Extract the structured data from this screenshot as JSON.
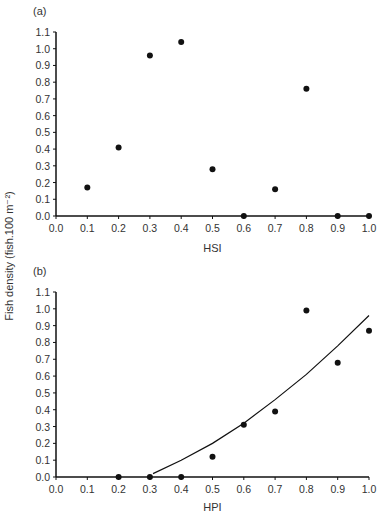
{
  "figure": {
    "ylabel": "Fish density (fish.100 m⁻²)",
    "panels": [
      {
        "label": "(a)",
        "xlabel": "HSI"
      },
      {
        "label": "(b)",
        "xlabel": "HPI"
      }
    ]
  },
  "chart_data": [
    {
      "type": "scatter",
      "title": "(a)",
      "xlabel": "HSI",
      "ylabel": "Fish density (fish.100 m-2)",
      "xlim": [
        0.0,
        1.0
      ],
      "ylim": [
        0.0,
        1.1
      ],
      "xticks": [
        "0.0",
        "0.1",
        "0.2",
        "0.3",
        "0.4",
        "0.5",
        "0.6",
        "0.7",
        "0.8",
        "0.9",
        "1.0"
      ],
      "yticks": [
        "0.0",
        "0.1",
        "0.2",
        "0.3",
        "0.4",
        "0.5",
        "0.6",
        "0.7",
        "0.8",
        "0.9",
        "1.0",
        "1.1"
      ],
      "grid": false,
      "series": [
        {
          "name": "observed",
          "x": [
            0.1,
            0.2,
            0.3,
            0.4,
            0.5,
            0.6,
            0.7,
            0.8,
            0.9,
            1.0
          ],
          "y": [
            0.17,
            0.41,
            0.96,
            1.04,
            0.28,
            0.0,
            0.16,
            0.76,
            0.0,
            0.0
          ]
        }
      ]
    },
    {
      "type": "scatter",
      "title": "(b)",
      "xlabel": "HPI",
      "ylabel": "Fish density (fish.100 m-2)",
      "xlim": [
        0.0,
        1.0
      ],
      "ylim": [
        0.0,
        1.1
      ],
      "xticks": [
        "0.0",
        "0.1",
        "0.2",
        "0.3",
        "0.4",
        "0.5",
        "0.6",
        "0.7",
        "0.8",
        "0.9",
        "1.0"
      ],
      "yticks": [
        "0.0",
        "0.1",
        "0.2",
        "0.3",
        "0.4",
        "0.5",
        "0.6",
        "0.7",
        "0.8",
        "0.9",
        "1.0",
        "1.1"
      ],
      "grid": false,
      "series": [
        {
          "name": "observed",
          "x": [
            0.2,
            0.3,
            0.4,
            0.5,
            0.6,
            0.7,
            0.8,
            0.9,
            1.0
          ],
          "y": [
            0.0,
            0.0,
            0.0,
            0.12,
            0.31,
            0.39,
            0.99,
            0.68,
            0.87
          ]
        },
        {
          "name": "fitted curve",
          "type": "line",
          "x": [
            0.31,
            0.4,
            0.5,
            0.6,
            0.7,
            0.8,
            0.9,
            1.0
          ],
          "y": [
            0.02,
            0.1,
            0.2,
            0.32,
            0.46,
            0.61,
            0.78,
            0.96
          ]
        }
      ]
    }
  ]
}
